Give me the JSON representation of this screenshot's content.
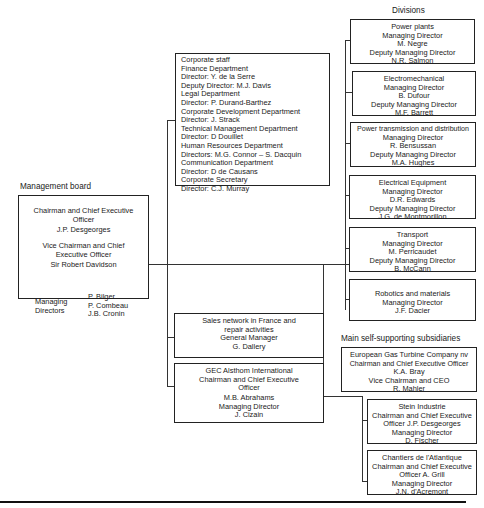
{
  "management_board": {
    "heading": "Management board",
    "chairman_title_1": "Chairman and Chief Executive",
    "chairman_title_2": "Officer",
    "chairman_name": "J.P. Desgeorges",
    "vice_title_1": "Vice Chairman and Chief",
    "vice_title_2": "Executive Officer",
    "vice_name": "Sir Robert Davidson",
    "md_label_1": "Managing",
    "md_label_2": "Directors",
    "md_names": [
      "P. Bilger",
      "P. Combeau",
      "J.B. Cronin"
    ]
  },
  "corporate_staff": {
    "lines": [
      "Corporate staff",
      "Finance Department",
      "Director: Y. de la Serre",
      "Deputy Director: M.J. Davis",
      "Legal Department",
      "Director: P. Durand-Barthez",
      "Corporate Development Department",
      "Director: J. Strack",
      "Technical Management Department",
      "Director: D Douillet",
      "Human Resources Department",
      "Directors: M.G. Connor – S. Dacquin",
      "Communication Department",
      "Director: D de Causans",
      "Corporate Secretary",
      "Director: C.J. Murray"
    ]
  },
  "sales_network": {
    "lines": [
      "Sales network in France and",
      "repair activities",
      "General Manager",
      "G. Dallery"
    ]
  },
  "gec_international": {
    "lines": [
      "GEC Alsthom International",
      "Chairman and Chief Executive",
      "Officer"
    ],
    "lines2": [
      "M.B. Abrahams",
      "Managing Director",
      "J. Cizain"
    ]
  },
  "divisions": {
    "heading": "Divisions",
    "items": [
      {
        "lines": [
          "Power plants",
          "Managing Director",
          "M. Negre",
          "Deputy Managing Director",
          "N.R. Salmon"
        ]
      },
      {
        "lines": [
          "Electromechanical",
          "Managing Director",
          "B. Dufour",
          "Deputy Managing Director",
          "M.F. Barrett"
        ]
      },
      {
        "lines": [
          "Power transmission and distribution",
          "Managing Director",
          "R. Bensussan",
          "Deputy Managing Director",
          "M.A. Hughes"
        ]
      },
      {
        "lines": [
          "Electrical Equipment",
          "Managing Director",
          "D.R. Edwards",
          "Deputy Managing Director",
          "J.G. de Montmorillon"
        ]
      },
      {
        "lines": [
          "Transport",
          "Managing Director",
          "M. Perricaudet",
          "Deputy Managing Director",
          "B. McCann"
        ]
      },
      {
        "lines": [
          "Robotics and materials",
          "Managing Director",
          "J.F. Dacier"
        ]
      }
    ]
  },
  "subsidiaries": {
    "heading": "Main self-supporting subsidiaries",
    "items": [
      {
        "lines": [
          "European Gas Turbine Company nv",
          "Chairman and Chief Executive Officer",
          "K.A. Bray",
          "Vice Chairman and CEO",
          "R. Mahler"
        ]
      },
      {
        "lines": [
          "Stein Industrie",
          "Chairman and Chief Executive",
          "Officer  J.P. Desgeorges",
          "Managing Director",
          "D. Fischer"
        ]
      },
      {
        "lines": [
          "Chantiers de l'Atlantique",
          "Chairman and Chief Executive",
          "Officer  A. Grill",
          "Managing Director",
          "J.N. d'Acremont"
        ]
      }
    ]
  }
}
